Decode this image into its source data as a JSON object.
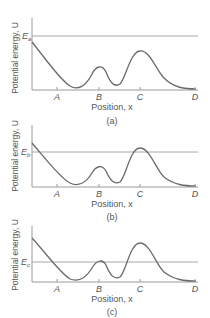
{
  "axis_labels": {
    "y": "Potential energy, U",
    "x": "Position, x"
  },
  "tick_labels": [
    "A",
    "B",
    "C",
    "D"
  ],
  "panels": [
    {
      "id": "a",
      "caption": "(a)",
      "energy_label": "E",
      "energy_subscript": "a"
    },
    {
      "id": "b",
      "caption": "(b)",
      "energy_label": "E",
      "energy_subscript": "b"
    },
    {
      "id": "c",
      "caption": "(c)",
      "energy_label": "E",
      "energy_subscript": "c"
    }
  ],
  "colors": {
    "curve": "#6a6a6a",
    "axis": "#9a9a9a",
    "energy_line": "#a8a8a8",
    "text": "#555555"
  }
}
